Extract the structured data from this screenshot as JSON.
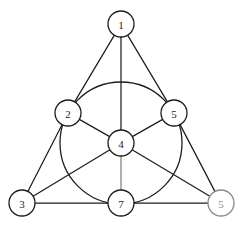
{
  "diagram": {
    "background_color": "#ffffff",
    "stroke_color": "#1d1d1d",
    "faded_stroke_color": "#8a8a8a",
    "node_radius": 13,
    "inner_circle": {
      "cx": 121,
      "cy": 143,
      "r": 61,
      "description": "circle through nodes 2, 5 and 7 centered on node 4"
    },
    "nodes": [
      {
        "id": "n1",
        "label": "1",
        "x": 121,
        "y": 24,
        "position": "top-apex",
        "faded": false
      },
      {
        "id": "n2",
        "label": "2",
        "x": 68,
        "y": 113,
        "position": "left-middle",
        "faded": false
      },
      {
        "id": "n5",
        "label": "5",
        "x": 174,
        "y": 113,
        "position": "right-middle",
        "faded": false
      },
      {
        "id": "n4",
        "label": "4",
        "x": 121,
        "y": 143,
        "position": "center",
        "faded": false
      },
      {
        "id": "n3",
        "label": "3",
        "x": 22,
        "y": 203,
        "position": "bottom-left",
        "faded": false
      },
      {
        "id": "n7",
        "label": "7",
        "x": 121,
        "y": 203,
        "position": "bottom-middle",
        "faded": false
      },
      {
        "id": "n6",
        "label": "5",
        "x": 221,
        "y": 203,
        "position": "bottom-right",
        "faded": true
      }
    ],
    "edges": [
      {
        "from": "n1",
        "to": "n2",
        "kind": "triangle-left-upper",
        "faded": false
      },
      {
        "from": "n2",
        "to": "n3",
        "kind": "triangle-left-lower",
        "faded": false
      },
      {
        "from": "n1",
        "to": "n5",
        "kind": "triangle-right-upper",
        "faded": false
      },
      {
        "from": "n5",
        "to": "n6",
        "kind": "triangle-right-lower",
        "faded": false
      },
      {
        "from": "n3",
        "to": "n7",
        "kind": "triangle-base-left",
        "faded": false
      },
      {
        "from": "n7",
        "to": "n6",
        "kind": "triangle-base-right",
        "faded": false
      },
      {
        "from": "n1",
        "to": "n4",
        "kind": "spoke-vertical-upper",
        "faded": false
      },
      {
        "from": "n4",
        "to": "n7",
        "kind": "spoke-vertical-lower",
        "faded": true
      },
      {
        "from": "n2",
        "to": "n4",
        "kind": "spoke-left",
        "faded": false
      },
      {
        "from": "n4",
        "to": "n6",
        "kind": "median-to-bottom-right",
        "faded": false
      },
      {
        "from": "n5",
        "to": "n4",
        "kind": "spoke-right",
        "faded": false
      },
      {
        "from": "n4",
        "to": "n3",
        "kind": "median-to-bottom-left",
        "faded": false
      }
    ]
  }
}
